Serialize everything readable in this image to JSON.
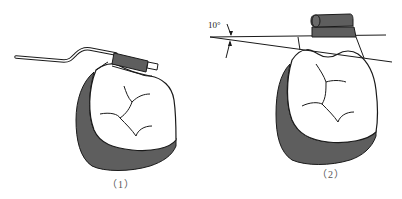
{
  "figure": {
    "panels": [
      {
        "id": "panel-1",
        "caption": "（1）"
      },
      {
        "id": "panel-2",
        "caption": "（2）",
        "angle_annotation": "10°"
      }
    ]
  },
  "colors": {
    "outline": "#1a1a1a",
    "shading": "#5e5e5e",
    "background": "#ffffff",
    "caption": "#555555"
  }
}
